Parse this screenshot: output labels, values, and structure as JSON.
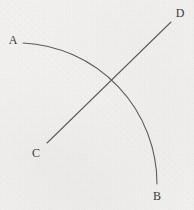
{
  "figure": {
    "background_color": "#f3f2f0",
    "stroke_color": "#5a5a5a",
    "label_color": "#3a3a3a",
    "width": 194,
    "height": 210
  },
  "labels": {
    "a": "A",
    "b": "B",
    "c": "C",
    "d": "D"
  },
  "chart_data": {
    "type": "scatter",
    "xlabel": "",
    "ylabel": "",
    "xlim": [
      0,
      194
    ],
    "ylim": [
      0,
      210
    ],
    "grid": false,
    "legend": "none",
    "annotations": [
      {
        "text": "A",
        "x": 13,
        "y": 40
      },
      {
        "text": "B",
        "x": 157,
        "y": 196
      },
      {
        "text": "C",
        "x": 36,
        "y": 153
      },
      {
        "text": "D",
        "x": 180,
        "y": 13
      }
    ],
    "series": [
      {
        "name": "arc-AB",
        "type": "arc",
        "stroke": "#5a5a5a",
        "start_point": {
          "label": "A",
          "x": 23,
          "y": 43
        },
        "end_point": {
          "label": "B",
          "x": 157,
          "y": 184
        },
        "center": {
          "x": 23,
          "y": 184
        },
        "radius": 141,
        "sweep": "clockwise",
        "path_points": [
          {
            "x": 23,
            "y": 43
          },
          {
            "x": 45,
            "y": 44
          },
          {
            "x": 65,
            "y": 48
          },
          {
            "x": 90,
            "y": 58
          },
          {
            "x": 110,
            "y": 70
          },
          {
            "x": 115,
            "y": 80
          },
          {
            "x": 125,
            "y": 92
          },
          {
            "x": 131,
            "y": 100
          },
          {
            "x": 137,
            "y": 112
          },
          {
            "x": 143,
            "y": 130
          },
          {
            "x": 150,
            "y": 150
          },
          {
            "x": 155,
            "y": 170
          },
          {
            "x": 157,
            "y": 184
          }
        ]
      },
      {
        "name": "line-CD",
        "type": "line",
        "stroke": "#5a5a5a",
        "start_point": {
          "label": "C",
          "x": 47,
          "y": 143
        },
        "end_point": {
          "label": "D",
          "x": 171,
          "y": 22
        },
        "path_points": [
          {
            "x": 47,
            "y": 143
          },
          {
            "x": 171,
            "y": 22
          }
        ]
      }
    ],
    "intersections": [
      {
        "of": [
          "arc-AB",
          "line-CD"
        ],
        "x": 115,
        "y": 80
      }
    ]
  }
}
